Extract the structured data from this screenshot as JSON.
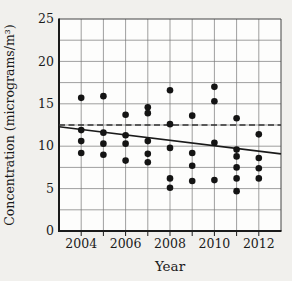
{
  "figure": {
    "kind": "statistics-textbook-scatterplot"
  },
  "chart_data": {
    "type": "scatter",
    "title": "",
    "xlabel": "Year",
    "ylabel": "Concentration (micrograms/m³)",
    "xlim": [
      2003,
      2013
    ],
    "ylim": [
      0,
      25
    ],
    "grid": true,
    "x_grid_step_years": 1,
    "y_grid_step": 2.5,
    "x_tick_labels": [
      "2004",
      "2006",
      "2008",
      "2010",
      "2012"
    ],
    "x_tick_values": [
      2004,
      2006,
      2008,
      2010,
      2012
    ],
    "y_tick_labels": [
      "0",
      "5",
      "10",
      "15",
      "20",
      "25"
    ],
    "y_tick_values": [
      0,
      5,
      10,
      15,
      20,
      25
    ],
    "series": [
      {
        "name": "yearly-concentration-observations",
        "marker": "filled-circle",
        "color": "#141414",
        "points": [
          {
            "x": 2004,
            "y": 15.7
          },
          {
            "x": 2004,
            "y": 11.9
          },
          {
            "x": 2004,
            "y": 10.6
          },
          {
            "x": 2004,
            "y": 9.2
          },
          {
            "x": 2005,
            "y": 15.9
          },
          {
            "x": 2005,
            "y": 11.6
          },
          {
            "x": 2005,
            "y": 10.3
          },
          {
            "x": 2005,
            "y": 9.0
          },
          {
            "x": 2006,
            "y": 13.7
          },
          {
            "x": 2006,
            "y": 11.3
          },
          {
            "x": 2006,
            "y": 10.3
          },
          {
            "x": 2006,
            "y": 8.3
          },
          {
            "x": 2007,
            "y": 14.6
          },
          {
            "x": 2007,
            "y": 13.9
          },
          {
            "x": 2007,
            "y": 10.6
          },
          {
            "x": 2007,
            "y": 9.1
          },
          {
            "x": 2007,
            "y": 8.1
          },
          {
            "x": 2008,
            "y": 16.6
          },
          {
            "x": 2008,
            "y": 12.6
          },
          {
            "x": 2008,
            "y": 9.8
          },
          {
            "x": 2008,
            "y": 6.2
          },
          {
            "x": 2008,
            "y": 5.1
          },
          {
            "x": 2009,
            "y": 13.6
          },
          {
            "x": 2009,
            "y": 9.2
          },
          {
            "x": 2009,
            "y": 7.7
          },
          {
            "x": 2009,
            "y": 5.9
          },
          {
            "x": 2010,
            "y": 17.0
          },
          {
            "x": 2010,
            "y": 15.3
          },
          {
            "x": 2010,
            "y": 10.4
          },
          {
            "x": 2010,
            "y": 6.0
          },
          {
            "x": 2011,
            "y": 13.3
          },
          {
            "x": 2011,
            "y": 9.6
          },
          {
            "x": 2011,
            "y": 8.8
          },
          {
            "x": 2011,
            "y": 7.5
          },
          {
            "x": 2011,
            "y": 6.2
          },
          {
            "x": 2011,
            "y": 4.7
          },
          {
            "x": 2012,
            "y": 11.4
          },
          {
            "x": 2012,
            "y": 8.6
          },
          {
            "x": 2012,
            "y": 7.4
          },
          {
            "x": 2012,
            "y": 6.2
          }
        ]
      }
    ],
    "trend_line": {
      "name": "regression-trend-line",
      "style": "solid",
      "color": "#1a1a1a",
      "x1": 2003,
      "y1": 12.3,
      "x2": 2013,
      "y2": 9.1
    },
    "reference_line": {
      "name": "dashed-reference-line",
      "style": "dashed",
      "color": "#333333",
      "y": 12.5,
      "x1": 2003,
      "x2": 2013
    },
    "legend": "none",
    "colors": {
      "background": "#f1f0ed",
      "plot_background": "#fdfdfc",
      "gridline": "#777777",
      "frame": "#444444",
      "axis": "#1a1a1a",
      "point": "#141414",
      "label": "#1b1b1b"
    }
  }
}
